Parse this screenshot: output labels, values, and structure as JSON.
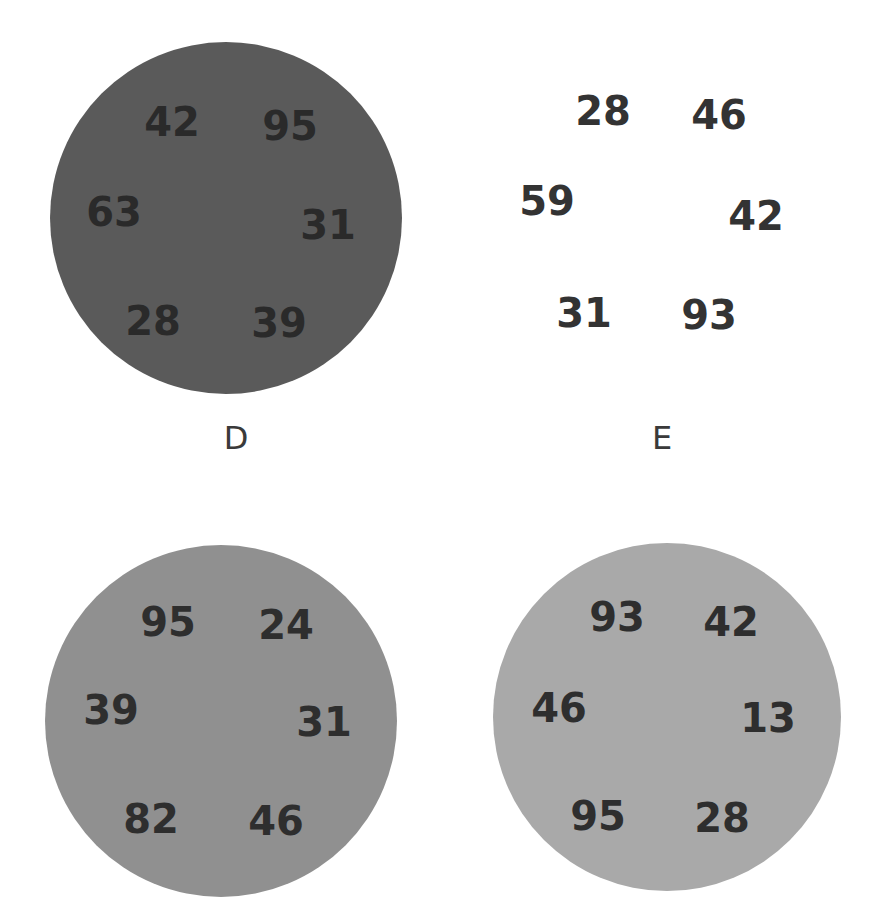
{
  "plates": [
    {
      "id": "D",
      "label": "D",
      "color": "#5a5a5a",
      "text_color": "#2a2a2a",
      "center": [
        226,
        218
      ],
      "radius": 176,
      "numbers": [
        {
          "value": "42",
          "x": 172,
          "y": 122
        },
        {
          "value": "95",
          "x": 290,
          "y": 126
        },
        {
          "value": "63",
          "x": 114,
          "y": 212
        },
        {
          "value": "31",
          "x": 328,
          "y": 225
        },
        {
          "value": "28",
          "x": 153,
          "y": 321
        },
        {
          "value": "39",
          "x": 279,
          "y": 323
        }
      ]
    },
    {
      "id": "E",
      "label": "E",
      "color": "#ffffff",
      "text_color": "#333333",
      "center": [
        666,
        218
      ],
      "radius": 176,
      "numbers": [
        {
          "value": "28",
          "x": 603,
          "y": 111
        },
        {
          "value": "46",
          "x": 719,
          "y": 115
        },
        {
          "value": "59",
          "x": 547,
          "y": 201
        },
        {
          "value": "42",
          "x": 756,
          "y": 216
        },
        {
          "value": "31",
          "x": 584,
          "y": 313
        },
        {
          "value": "93",
          "x": 709,
          "y": 315
        }
      ]
    },
    {
      "id": "F",
      "label": "",
      "color": "#909090",
      "text_color": "#2e2e2e",
      "center": [
        221,
        721
      ],
      "radius": 176,
      "numbers": [
        {
          "value": "95",
          "x": 168,
          "y": 622
        },
        {
          "value": "24",
          "x": 286,
          "y": 625
        },
        {
          "value": "39",
          "x": 111,
          "y": 710
        },
        {
          "value": "31",
          "x": 324,
          "y": 722
        },
        {
          "value": "82",
          "x": 151,
          "y": 819
        },
        {
          "value": "46",
          "x": 276,
          "y": 821
        }
      ]
    },
    {
      "id": "G",
      "label": "",
      "color": "#a9a9a9",
      "text_color": "#2e2e2e",
      "center": [
        667,
        717
      ],
      "radius": 174,
      "numbers": [
        {
          "value": "93",
          "x": 617,
          "y": 617
        },
        {
          "value": "42",
          "x": 731,
          "y": 622
        },
        {
          "value": "46",
          "x": 559,
          "y": 708
        },
        {
          "value": "13",
          "x": 768,
          "y": 718
        },
        {
          "value": "95",
          "x": 598,
          "y": 816
        },
        {
          "value": "28",
          "x": 722,
          "y": 818
        }
      ]
    }
  ]
}
